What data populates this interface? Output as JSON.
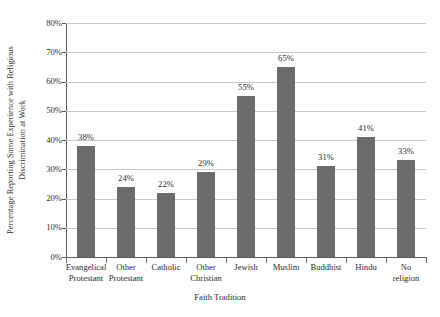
{
  "chart_data": {
    "type": "bar",
    "title": "",
    "xlabel": "Faith Tradition",
    "ylabel": "Percentage Reporting Some Experience with Religious Discrimination at Work",
    "ylabel_line1": "Percentage Reporting Some Experience with Religious",
    "ylabel_line2": "Discrimination at Work",
    "categories": [
      "Evangelical Protestant",
      "Other Protestant",
      "Catholic",
      "Other Christian",
      "Jewish",
      "Muslim",
      "Buddhist",
      "Hindu",
      "No religion"
    ],
    "category_lines": [
      [
        "Evangelical",
        "Protestant"
      ],
      [
        "Other",
        "Protestant"
      ],
      [
        "Catholic",
        ""
      ],
      [
        "Other",
        "Christian"
      ],
      [
        "Jewish",
        ""
      ],
      [
        "Muslim",
        ""
      ],
      [
        "Buddhist",
        ""
      ],
      [
        "Hindu",
        ""
      ],
      [
        "No",
        "religion"
      ]
    ],
    "values": [
      38,
      24,
      22,
      29,
      55,
      65,
      31,
      41,
      33
    ],
    "data_labels": [
      "38%",
      "24%",
      "22%",
      "29%",
      "55%",
      "65%",
      "31%",
      "41%",
      "33%"
    ],
    "ylim": [
      0,
      80
    ],
    "ytick_values": [
      0,
      10,
      20,
      30,
      40,
      50,
      60,
      70,
      80
    ],
    "ytick_labels": [
      "0%",
      "10%",
      "20%",
      "30%",
      "40%",
      "50%",
      "60%",
      "70%",
      "80%"
    ],
    "grid": true,
    "grid_axis": "y",
    "legend": false,
    "legend_position": "none",
    "bar_color": "#6b6b6b",
    "gridline_color": "#c8c8c8",
    "axis_color": "#5a5a5a",
    "background_color": "#ffffff",
    "series": [
      {
        "name": "Percentage Reporting Some Experience with Religious Discrimination at Work",
        "values": [
          38,
          24,
          22,
          29,
          55,
          65,
          31,
          41,
          33
        ]
      }
    ]
  }
}
